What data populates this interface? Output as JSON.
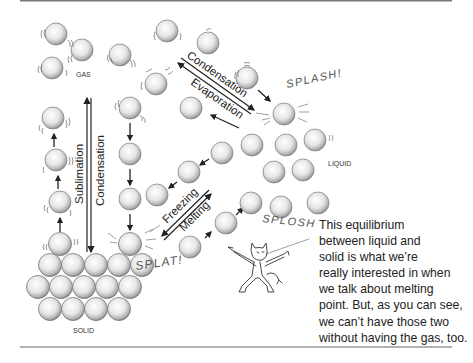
{
  "labels": {
    "gas": "GAS",
    "liquid": "LIQUID",
    "solid": "SOLID"
  },
  "arrows": {
    "sublimation": "Sublimation",
    "condensation_vertical": "Condensation",
    "condensation_diagonal": "Condensation",
    "evaporation": "Evaporation",
    "freezing": "Freezing",
    "melting": "Melting"
  },
  "sound_effects": {
    "splash": "SPLASH!",
    "splat": "SPLAT!",
    "splosh": "SPLOSH"
  },
  "caption": {
    "lines": [
      "This equilibrium",
      "between liquid and",
      "solid is what we’re",
      "really interested in when",
      "we talk about melting",
      "point. But, as you can see,",
      "we can’t have those two",
      "without having the gas, too."
    ]
  },
  "colors": {
    "ink": "#2a2a2a",
    "molecule_fill": "#f4f4f4",
    "molecule_shade": "#8a8a8a",
    "rule": "#777777"
  },
  "icons": {
    "character": "devil-cartoon-icon",
    "molecule": "molecule-sphere-icon"
  }
}
